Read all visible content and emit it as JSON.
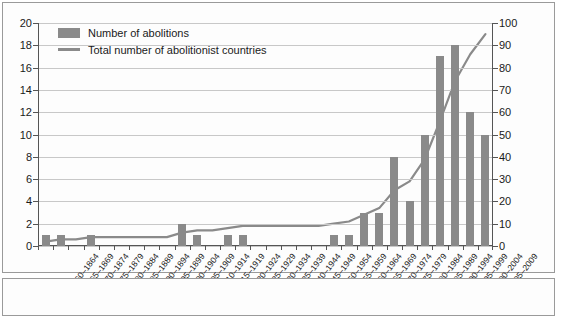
{
  "chart_data": {
    "type": "bar",
    "title": "",
    "xlabel": "",
    "ylabel": "",
    "grid": true,
    "legend_position": "top-left",
    "categories": [
      "1860–1864",
      "1865–1869",
      "1870–1874",
      "1875–1879",
      "1880–1884",
      "1885–1889",
      "1890–1894",
      "1895–1899",
      "1900–1904",
      "1905–1909",
      "1910–1914",
      "1915–1919",
      "1920–1924",
      "1925–1929",
      "1930–1934",
      "1935–1939",
      "1940–1944",
      "1945–1949",
      "1950–1954",
      "1955–1959",
      "1960–1964",
      "1965–1969",
      "1970–1974",
      "1975–1979",
      "1980–1984",
      "1985–1989",
      "1990–1994",
      "1995–1999",
      "2000–2004",
      "2005–2009"
    ],
    "series": [
      {
        "name": "Number of abolitions",
        "kind": "bar",
        "axis": "left",
        "color": "#8a8a8a",
        "values": [
          1,
          1,
          0,
          1,
          0,
          0,
          0,
          0,
          0,
          2,
          1,
          0,
          1,
          1,
          0,
          0,
          0,
          0,
          0,
          1,
          1,
          3,
          3,
          8,
          4,
          10,
          17,
          18,
          12,
          10
        ]
      },
      {
        "name": "Total number of abolitionist countries",
        "kind": "line",
        "axis": "right",
        "color": "#8a8a8a",
        "values": [
          2,
          3,
          3,
          4,
          4,
          4,
          4,
          4,
          4,
          6,
          7,
          7,
          8,
          9,
          9,
          9,
          9,
          9,
          9,
          10,
          11,
          14,
          17,
          25,
          29,
          39,
          56,
          74,
          86,
          95
        ]
      }
    ],
    "y_left": {
      "min": 0,
      "max": 20,
      "step": 2,
      "ticks": [
        "0",
        "2",
        "4",
        "6",
        "8",
        "10",
        "12",
        "14",
        "16",
        "18",
        "20"
      ]
    },
    "y_right": {
      "min": 0,
      "max": 100,
      "step": 10,
      "ticks": [
        "0",
        "10",
        "20",
        "30",
        "40",
        "50",
        "60",
        "70",
        "80",
        "90",
        "100"
      ]
    }
  },
  "legend": {
    "items": [
      {
        "label": "Number of abolitions",
        "marker": "bar-swatch"
      },
      {
        "label": "Total number of abolitionist countries",
        "marker": "line-swatch"
      }
    ]
  }
}
